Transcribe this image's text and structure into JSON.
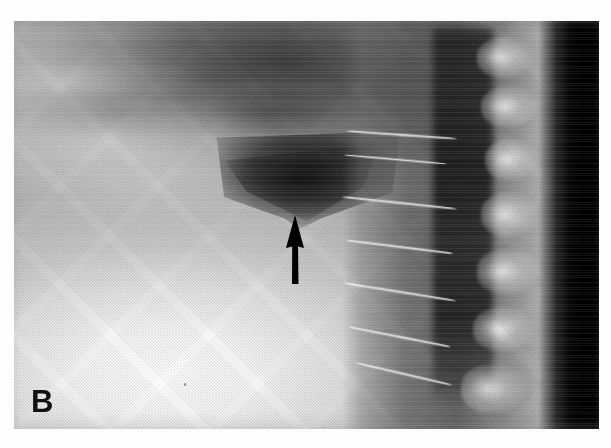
{
  "figure": {
    "kind": "radiograph",
    "modality": "X-ray",
    "view": "lateral cervical spine",
    "panel_label": "B",
    "background_color": "#ffffff",
    "film_edge": {
      "left": 14,
      "top": 21,
      "width": 585,
      "height": 408
    }
  },
  "annotations": [
    {
      "name": "pointer-arrow",
      "shape": "solid-arrow",
      "direction": "up",
      "color": "#000000",
      "tip": {
        "x": 295,
        "y": 215
      },
      "tail": {
        "x": 295,
        "y": 284
      }
    }
  ],
  "regions": [
    {
      "name": "soft-tissue-bright-field",
      "tone": "bright",
      "location": "lower-left"
    },
    {
      "name": "skull-base-dark-tissue",
      "tone": "dark",
      "location": "upper-center"
    },
    {
      "name": "prevertebral-air-wedge",
      "tone": "very-dark",
      "location": "center"
    },
    {
      "name": "vertebral-column",
      "tone": "mixed",
      "location": "right"
    },
    {
      "name": "exposure-black-band",
      "tone": "black",
      "location": "far-right"
    }
  ],
  "colors": {
    "page": "#ffffff",
    "film_base": "#8a8a8a",
    "bright_tissue": "#fdfdfd",
    "dark_tissue": "#3c3c3c",
    "black_band": "#000000",
    "annotation": "#000000",
    "label_text": "#111111"
  },
  "labels": {
    "panel": "B"
  }
}
